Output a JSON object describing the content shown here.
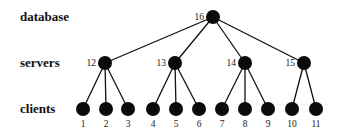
{
  "diagram": {
    "type": "tree",
    "tiers": [
      {
        "id": "database",
        "label": "database",
        "y": 17
      },
      {
        "id": "servers",
        "label": "servers",
        "y": 63
      },
      {
        "id": "clients",
        "label": "clients",
        "y": 109
      }
    ],
    "node_radius": 7,
    "node_color": "#0a0a0a",
    "nodes": [
      {
        "id": "16",
        "label": "16",
        "tier": "database",
        "x": 213,
        "y": 17,
        "label_pos": "left"
      },
      {
        "id": "12",
        "label": "12",
        "tier": "servers",
        "x": 105,
        "y": 63,
        "label_pos": "left"
      },
      {
        "id": "13",
        "label": "13",
        "tier": "servers",
        "x": 175,
        "y": 63,
        "label_pos": "left"
      },
      {
        "id": "14",
        "label": "14",
        "tier": "servers",
        "x": 245,
        "y": 63,
        "label_pos": "left"
      },
      {
        "id": "15",
        "label": "15",
        "tier": "servers",
        "x": 304,
        "y": 63,
        "label_pos": "left"
      },
      {
        "id": "1",
        "label": "1",
        "tier": "clients",
        "x": 83,
        "y": 109,
        "label_pos": "below"
      },
      {
        "id": "2",
        "label": "2",
        "tier": "clients",
        "x": 106,
        "y": 109,
        "label_pos": "below"
      },
      {
        "id": "3",
        "label": "3",
        "tier": "clients",
        "x": 128,
        "y": 109,
        "label_pos": "below"
      },
      {
        "id": "4",
        "label": "4",
        "tier": "clients",
        "x": 153,
        "y": 109,
        "label_pos": "below"
      },
      {
        "id": "5",
        "label": "5",
        "tier": "clients",
        "x": 176,
        "y": 109,
        "label_pos": "below"
      },
      {
        "id": "6",
        "label": "6",
        "tier": "clients",
        "x": 199,
        "y": 109,
        "label_pos": "below"
      },
      {
        "id": "7",
        "label": "7",
        "tier": "clients",
        "x": 222,
        "y": 109,
        "label_pos": "below"
      },
      {
        "id": "8",
        "label": "8",
        "tier": "clients",
        "x": 245,
        "y": 109,
        "label_pos": "below"
      },
      {
        "id": "9",
        "label": "9",
        "tier": "clients",
        "x": 268,
        "y": 109,
        "label_pos": "below"
      },
      {
        "id": "10",
        "label": "10",
        "tier": "clients",
        "x": 292,
        "y": 109,
        "label_pos": "below"
      },
      {
        "id": "11",
        "label": "11",
        "tier": "clients",
        "x": 316,
        "y": 109,
        "label_pos": "below"
      }
    ],
    "edges": [
      [
        "16",
        "12"
      ],
      [
        "16",
        "13"
      ],
      [
        "16",
        "14"
      ],
      [
        "16",
        "15"
      ],
      [
        "12",
        "1"
      ],
      [
        "12",
        "2"
      ],
      [
        "12",
        "3"
      ],
      [
        "13",
        "4"
      ],
      [
        "13",
        "5"
      ],
      [
        "13",
        "6"
      ],
      [
        "14",
        "7"
      ],
      [
        "14",
        "8"
      ],
      [
        "14",
        "9"
      ],
      [
        "15",
        "10"
      ],
      [
        "15",
        "11"
      ]
    ]
  }
}
